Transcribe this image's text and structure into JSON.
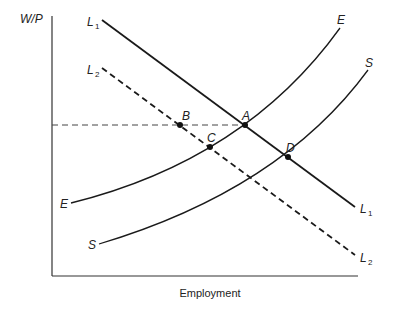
{
  "diagram": {
    "y_axis_label": "W/P",
    "x_axis_label": "Employment",
    "curves": {
      "L1": {
        "label": "L",
        "sub": "1",
        "style": "solid"
      },
      "L2": {
        "label": "L",
        "sub": "2",
        "style": "dashed"
      },
      "E": {
        "label": "E",
        "style": "solid"
      },
      "S": {
        "label": "S",
        "style": "solid"
      }
    },
    "points": {
      "A": "A",
      "B": "B",
      "C": "C",
      "D": "D"
    },
    "colors": {
      "line": "#1a1a1a",
      "dashed": "#333333"
    }
  }
}
